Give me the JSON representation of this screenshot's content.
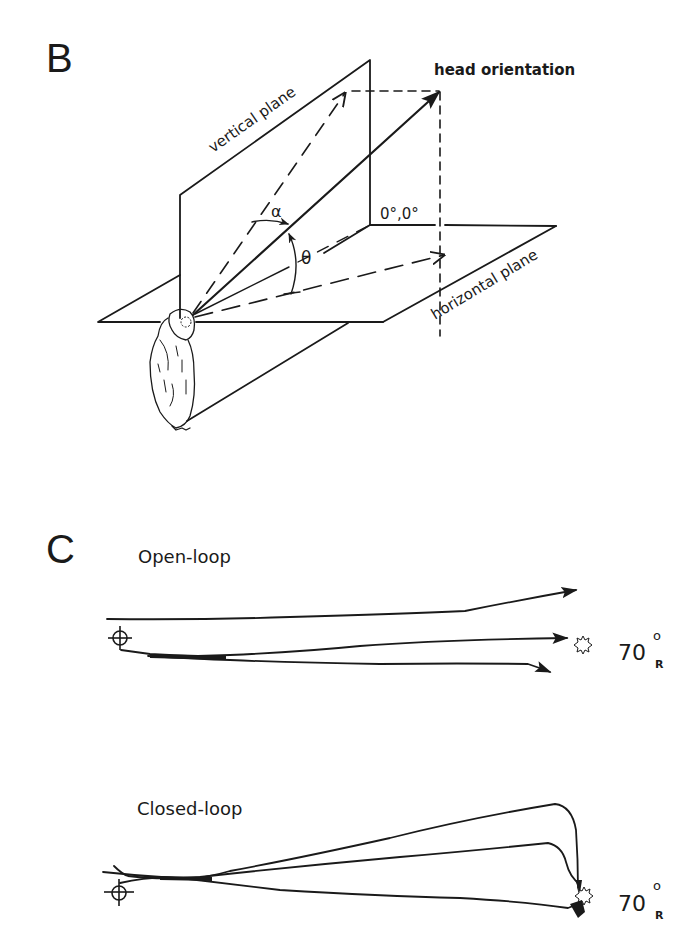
{
  "panel_b": {
    "letter": "B",
    "labels": {
      "vertical_plane": "vertical plane",
      "horizontal_plane": "horizontal plane",
      "head_orientation": "head orientation",
      "origin": "0°,0°",
      "alpha": "α",
      "theta": "θ"
    },
    "icons": [
      "owl-illustration",
      "head-orientation-arrow",
      "vertical-projection-arrow",
      "horizontal-projection-arrow"
    ]
  },
  "panel_c": {
    "letter": "C",
    "open_loop": {
      "title": "Open-loop",
      "target_angle": "70",
      "target_degree": "o",
      "target_side": "R",
      "icons": [
        "crosshair-start-icon",
        "star-target-icon"
      ]
    },
    "closed_loop": {
      "title": "Closed-loop",
      "target_angle": "70",
      "target_degree": "o",
      "target_side": "R",
      "icons": [
        "crosshair-start-icon",
        "star-target-icon"
      ]
    }
  },
  "colors": {
    "ink": "#1a1a1a",
    "background": "#ffffff"
  }
}
